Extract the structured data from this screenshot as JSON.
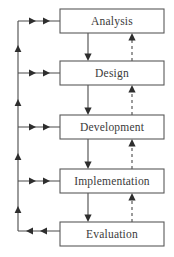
{
  "diagram": {
    "type": "flowchart",
    "canvas": {
      "width": 174,
      "height": 257
    },
    "colors": {
      "background": "#ffffff",
      "box_fill": "#ffffff",
      "box_stroke": "#5a5a5a",
      "line": "#4a4a4a",
      "arrow": "#2e2e2e",
      "text": "#3a3a3a"
    },
    "phases": [
      {
        "id": "analysis",
        "label": "Analysis",
        "x": 60,
        "y": 9,
        "w": 104,
        "h": 24
      },
      {
        "id": "design",
        "label": "Design",
        "x": 60,
        "y": 61,
        "w": 104,
        "h": 24
      },
      {
        "id": "development",
        "label": "Development",
        "x": 60,
        "y": 115,
        "w": 104,
        "h": 24
      },
      {
        "id": "implementation",
        "label": "Implementation",
        "x": 60,
        "y": 169,
        "w": 104,
        "h": 24
      },
      {
        "id": "evaluation",
        "label": "Evaluation",
        "x": 60,
        "y": 222,
        "w": 104,
        "h": 24
      }
    ],
    "forward_flow": {
      "style": "solid",
      "direction": "downward",
      "x": 88,
      "segments": [
        {
          "from": "analysis",
          "to": "design"
        },
        {
          "from": "design",
          "to": "development"
        },
        {
          "from": "development",
          "to": "implementation"
        },
        {
          "from": "implementation",
          "to": "evaluation"
        }
      ]
    },
    "feedback_flow_dashed": {
      "style": "dashed",
      "direction": "upward",
      "x": 132,
      "segments": [
        {
          "from": "design",
          "to": "analysis"
        },
        {
          "from": "development",
          "to": "design"
        },
        {
          "from": "implementation",
          "to": "development"
        },
        {
          "from": "evaluation",
          "to": "implementation"
        }
      ]
    },
    "return_rail": {
      "style": "solid",
      "x": 18,
      "bottom_y": 231,
      "direction": "upward",
      "note": "Evaluation feeds back to every prior phase via left rail",
      "branch_targets": [
        "analysis",
        "design",
        "development",
        "implementation"
      ],
      "branch_y": [
        21,
        73,
        127,
        181
      ]
    }
  }
}
